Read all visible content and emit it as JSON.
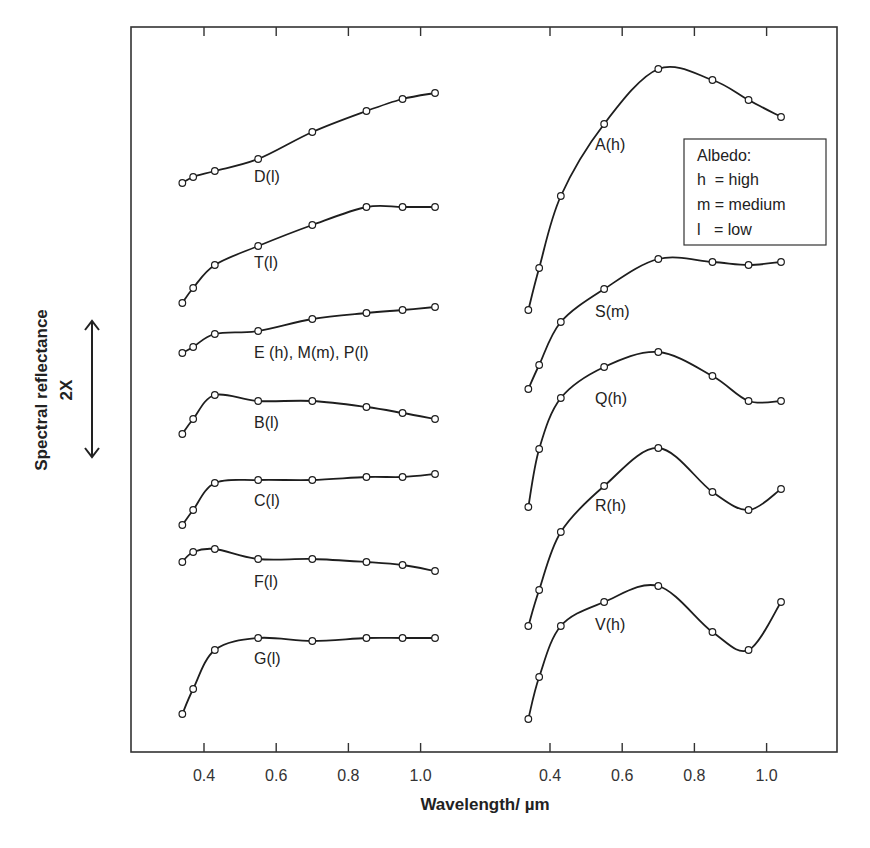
{
  "chart_data": {
    "type": "line",
    "title": "",
    "xlabel": "Wavelength/ µm",
    "ylabel": "Spectral reflectance",
    "y_scale_note": "2X",
    "grid": false,
    "x_ticks": [
      "0.4",
      "0.6",
      "0.8",
      "1.0"
    ],
    "panels": [
      {
        "name": "left",
        "xlim": [
          0.25,
          1.15
        ],
        "x": [
          0.34,
          0.37,
          0.43,
          0.55,
          0.7,
          0.85,
          0.95,
          1.04
        ],
        "series": [
          {
            "name": "D(l)",
            "values": [
              183,
              177,
              171,
              159,
              132,
              111,
              99,
              93
            ],
            "label_pos": [
              254,
              182
            ]
          },
          {
            "name": "T(l)",
            "values": [
              303,
              288,
              265,
              246,
              225,
              207,
              207,
              207
            ],
            "label_pos": [
              254,
              268
            ]
          },
          {
            "name": "E (h), M(m), P(l)",
            "values": [
              353,
              347,
              334,
              331,
              319,
              313,
              310,
              307
            ],
            "label_pos": [
              254,
              358
            ]
          },
          {
            "name": "B(l)",
            "values": [
              434,
              419,
              395,
              401,
              401,
              407,
              413,
              419
            ],
            "label_pos": [
              254,
              428
            ]
          },
          {
            "name": "C(l)",
            "values": [
              525,
              510,
              483,
              480,
              480,
              477,
              477,
              474
            ],
            "label_pos": [
              254,
              506
            ]
          },
          {
            "name": "F(l)",
            "values": [
              562,
              552,
              549,
              559,
              559,
              562,
              565,
              571
            ],
            "label_pos": [
              254,
              587
            ]
          },
          {
            "name": "G(l)",
            "values": [
              714,
              689,
              650,
              638,
              641,
              638,
              638,
              638
            ],
            "label_pos": [
              254,
              664
            ]
          }
        ]
      },
      {
        "name": "right",
        "xlim": [
          0.25,
          1.15
        ],
        "x": [
          0.34,
          0.37,
          0.43,
          0.55,
          0.7,
          0.85,
          0.95,
          1.04
        ],
        "series": [
          {
            "name": "A(h)",
            "values": [
              310,
              268,
              196,
              124,
              69,
              80,
              100,
              117
            ],
            "label_pos": [
              595,
              150
            ]
          },
          {
            "name": "S(m)",
            "values": [
              389,
              365,
              322,
              289,
              259,
              262,
              265,
              262
            ],
            "label_pos": [
              595,
              317
            ]
          },
          {
            "name": "Q(h)",
            "values": [
              507,
              449,
              398,
              367,
              352,
              376,
              401,
              401
            ],
            "label_pos": [
              595,
              404
            ]
          },
          {
            "name": "R(h)",
            "values": [
              626,
              590,
              532,
              486,
              448,
              492,
              510,
              489
            ],
            "label_pos": [
              595,
              511
            ]
          },
          {
            "name": "V(h)",
            "values": [
              719,
              677,
              626,
              602,
              586,
              632,
              650,
              602
            ],
            "label_pos": [
              595,
              630
            ]
          }
        ]
      }
    ],
    "values_note": "Values are relative vertical positions (pixel y, smaller = higher reflectance); curves are offset vertically for clarity.",
    "legend": {
      "title": "Albedo:",
      "entries": [
        "h  = high",
        "m = medium",
        "l   = low"
      ]
    }
  },
  "labels": {
    "xlabel": "Wavelength/ µm",
    "ylabel": "Spectral reflectance",
    "yscale": "2X",
    "legend_title": "Albedo:",
    "legend_h": "h  = high",
    "legend_m": "m = medium",
    "legend_l": "l   = low"
  }
}
